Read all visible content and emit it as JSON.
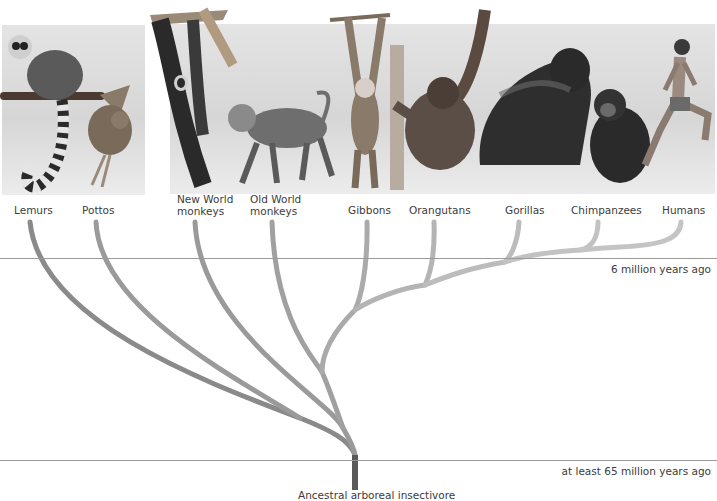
{
  "diagram": {
    "type": "phylogenetic-tree",
    "taxa": [
      {
        "id": "lemurs",
        "label": "Lemurs"
      },
      {
        "id": "pottos",
        "label": "Pottos"
      },
      {
        "id": "new-world-monkeys",
        "label_line1": "New World",
        "label_line2": "monkeys"
      },
      {
        "id": "old-world-monkeys",
        "label_line1": "Old World",
        "label_line2": "monkeys"
      },
      {
        "id": "gibbons",
        "label": "Gibbons"
      },
      {
        "id": "orangutans",
        "label": "Orangutans"
      },
      {
        "id": "gorillas",
        "label": "Gorillas"
      },
      {
        "id": "chimpanzees",
        "label": "Chimpanzees"
      },
      {
        "id": "humans",
        "label": "Humans"
      }
    ],
    "timelines": [
      {
        "label": "6 million years ago"
      },
      {
        "label": "at least 65 million years ago"
      }
    ],
    "root_label": "Ancestral arboreal insectivore",
    "colors": {
      "branch_light": "#c4c4c4",
      "branch_mid": "#9a9a9a",
      "branch_dark": "#5e5e5e",
      "timeline": "#9a9a9a",
      "text": "#3c3c3c"
    }
  }
}
